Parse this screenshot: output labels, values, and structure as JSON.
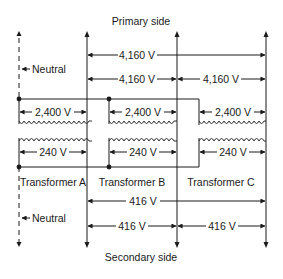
{
  "title_top": "Primary side",
  "title_bottom": "Secondary side",
  "neutral_top": "Neutral",
  "neutral_bottom": "Neutral",
  "primary": {
    "line_to_line_full": "4,160 V",
    "line_to_line_ab": "4,160 V",
    "line_to_line_bc": "4,160 V"
  },
  "transformers": [
    {
      "name": "Transformer A",
      "primary_voltage": "2,400 V",
      "secondary_voltage": "240 V"
    },
    {
      "name": "Transformer B",
      "primary_voltage": "2,400 V",
      "secondary_voltage": "240 V"
    },
    {
      "name": "Transformer C",
      "primary_voltage": "2,400 V",
      "secondary_voltage": "240 V"
    }
  ],
  "secondary": {
    "line_to_line_full": "416 V",
    "line_to_line_ab": "416 V",
    "line_to_line_bc": "416 V"
  },
  "colors": {
    "ink": "#1a1a1a",
    "background": "#ffffff"
  }
}
